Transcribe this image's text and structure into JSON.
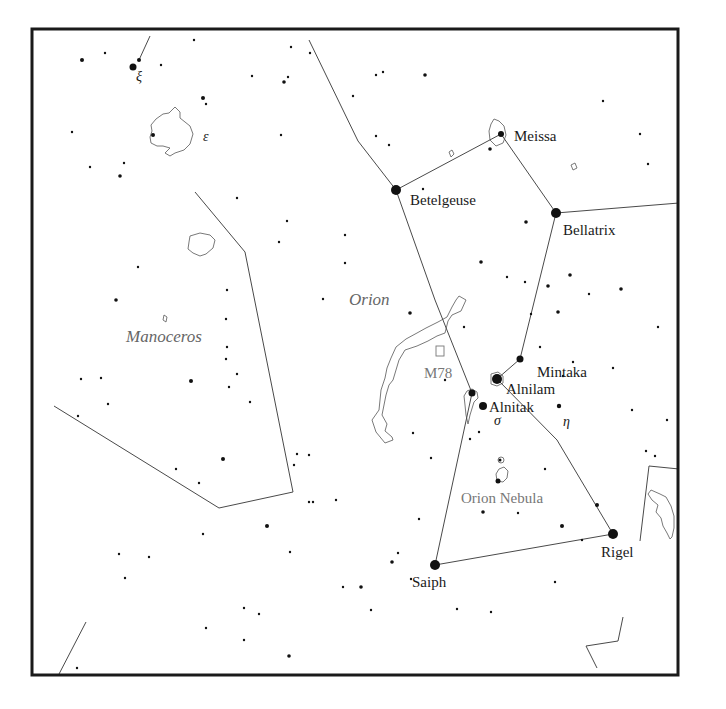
{
  "chart_title": "Orion star chart",
  "frame": {
    "x": 32,
    "y": 29,
    "w": 646,
    "h": 646
  },
  "constellations": [
    {
      "name": "Orion",
      "x": 349,
      "y": 305
    },
    {
      "name": "Manoceros",
      "x": 126,
      "y": 342
    }
  ],
  "deep_sky_objects": [
    {
      "name": "M78",
      "x": 424,
      "y": 378,
      "box": {
        "x": 436,
        "y": 346,
        "w": 8,
        "h": 10
      }
    },
    {
      "name": "Orion Nebula",
      "x": 461,
      "y": 503
    }
  ],
  "named_stars": [
    {
      "name": "Betelgeuse",
      "x": 396,
      "y": 190,
      "r": 5,
      "label_x": 410,
      "label_y": 205
    },
    {
      "name": "Meissa",
      "x": 501,
      "y": 134,
      "r": 3,
      "label_x": 514,
      "label_y": 141
    },
    {
      "name": "Bellatrix",
      "x": 556,
      "y": 213,
      "r": 5,
      "label_x": 563,
      "label_y": 235
    },
    {
      "name": "Mintaka",
      "x": 520,
      "y": 359,
      "r": 3.5,
      "label_x": 537,
      "label_y": 377
    },
    {
      "name": "Alnilam",
      "x": 497,
      "y": 379,
      "r": 5,
      "label_x": 506,
      "label_y": 394
    },
    {
      "name": "Alnitak",
      "x": 483,
      "y": 406,
      "r": 4,
      "label_x": 489,
      "label_y": 412
    },
    {
      "name": "Rigel",
      "x": 613,
      "y": 534,
      "r": 5,
      "label_x": 601,
      "label_y": 557
    },
    {
      "name": "Saiph",
      "x": 435,
      "y": 565,
      "r": 5,
      "label_x": 412,
      "label_y": 587
    }
  ],
  "greek_labels": [
    {
      "symbol": "σ",
      "x": 494,
      "y": 425
    },
    {
      "symbol": "η",
      "x": 563,
      "y": 426
    },
    {
      "symbol": "ξ",
      "x": 136,
      "y": 81
    },
    {
      "symbol": "ε",
      "x": 203,
      "y": 141
    }
  ],
  "constellation_lines": [
    {
      "points": [
        [
          309,
          40
        ],
        [
          358,
          141
        ],
        [
          396,
          190
        ],
        [
          435,
          300
        ],
        [
          472,
          393
        ],
        [
          435,
          565
        ],
        [
          613,
          534
        ],
        [
          557,
          440
        ],
        [
          497,
          379
        ],
        [
          520,
          359
        ],
        [
          556,
          213
        ],
        [
          679,
          203
        ]
      ]
    },
    {
      "points": [
        [
          396,
          190
        ],
        [
          501,
          134
        ],
        [
          556,
          213
        ]
      ]
    },
    {
      "points": [
        [
          150,
          36
        ],
        [
          139,
          60
        ]
      ]
    },
    {
      "points": [
        [
          195,
          192
        ],
        [
          245,
          252
        ],
        [
          293,
          492
        ],
        [
          219,
          508
        ],
        [
          54,
          406
        ]
      ]
    },
    {
      "points": [
        [
          649,
          466
        ],
        [
          640,
          541
        ]
      ]
    },
    {
      "points": [
        [
          649,
          466
        ],
        [
          679,
          469
        ]
      ]
    },
    {
      "points": [
        [
          86,
          622
        ],
        [
          58,
          676
        ]
      ]
    },
    {
      "points": [
        [
          623,
          617
        ],
        [
          618,
          641
        ],
        [
          586,
          646
        ],
        [
          597,
          668
        ]
      ]
    }
  ],
  "stars": [
    [
      133,
      67,
      3.5
    ],
    [
      139,
      60,
      2
    ],
    [
      82,
      60,
      2
    ],
    [
      105,
      53,
      1.2
    ],
    [
      161,
      65,
      1.2
    ],
    [
      194,
      40,
      1.2
    ],
    [
      203,
      98,
      2
    ],
    [
      206,
      104,
      1.2
    ],
    [
      153,
      135,
      2
    ],
    [
      72,
      132,
      1.2
    ],
    [
      90,
      167,
      1.2
    ],
    [
      124,
      163,
      1.2
    ],
    [
      120,
      176,
      1.8
    ],
    [
      252,
      76,
      1.2
    ],
    [
      284,
      82,
      1.8
    ],
    [
      288,
      77,
      1.2
    ],
    [
      281,
      135,
      1.2
    ],
    [
      291,
      47,
      1.2
    ],
    [
      310,
      53,
      1.2
    ],
    [
      353,
      96,
      1.2
    ],
    [
      383,
      72,
      1.2
    ],
    [
      376,
      75,
      1.2
    ],
    [
      237,
      198,
      1.2
    ],
    [
      287,
      221,
      1.2
    ],
    [
      279,
      242,
      1.2
    ],
    [
      345,
      235,
      1.2
    ],
    [
      345,
      263,
      1.2
    ],
    [
      138,
      267,
      1.2
    ],
    [
      116,
      300,
      1.8
    ],
    [
      227,
      290,
      1.2
    ],
    [
      226,
      319,
      1.2
    ],
    [
      323,
      299,
      1.2
    ],
    [
      227,
      347,
      1.2
    ],
    [
      226,
      359,
      1.2
    ],
    [
      237,
      374,
      1.2
    ],
    [
      101,
      378,
      1.2
    ],
    [
      81,
      379,
      1.2
    ],
    [
      191,
      381,
      2
    ],
    [
      229,
      387,
      1.2
    ],
    [
      250,
      402,
      1.2
    ],
    [
      108,
      404,
      1.2
    ],
    [
      78,
      416,
      1.2
    ],
    [
      223,
      459,
      2
    ],
    [
      176,
      469,
      1.2
    ],
    [
      199,
      483,
      1.2
    ],
    [
      297,
      454,
      1.2
    ],
    [
      294,
      465,
      1.2
    ],
    [
      309,
      455,
      1.2
    ],
    [
      309,
      502,
      1.2
    ],
    [
      313,
      502,
      1.2
    ],
    [
      336,
      500,
      1.2
    ],
    [
      267,
      526,
      2
    ],
    [
      203,
      534,
      1.2
    ],
    [
      290,
      552,
      1.2
    ],
    [
      119,
      554,
      1.2
    ],
    [
      149,
      557,
      1.2
    ],
    [
      125,
      578,
      1.2
    ],
    [
      244,
      608,
      1.2
    ],
    [
      259,
      614,
      1.2
    ],
    [
      206,
      628,
      1.2
    ],
    [
      244,
      640,
      1.2
    ],
    [
      289,
      656,
      1.8
    ],
    [
      77,
      668,
      1.2
    ],
    [
      343,
      587,
      1.2
    ],
    [
      361,
      587,
      1.8
    ],
    [
      425,
      75,
      1.8
    ],
    [
      376,
      136,
      1.2
    ],
    [
      389,
      145,
      1.2
    ],
    [
      423,
      189,
      1.2
    ],
    [
      490,
      149,
      1.8
    ],
    [
      603,
      101,
      1.2
    ],
    [
      640,
      134,
      1.2
    ],
    [
      648,
      164,
      1.2
    ],
    [
      526,
      222,
      1.8
    ],
    [
      481,
      262,
      1.8
    ],
    [
      507,
      277,
      1.2
    ],
    [
      525,
      282,
      1.2
    ],
    [
      570,
      275,
      1.8
    ],
    [
      548,
      286,
      1.8
    ],
    [
      589,
      294,
      1.2
    ],
    [
      621,
      289,
      1.8
    ],
    [
      658,
      327,
      1.2
    ],
    [
      558,
      312,
      1.8
    ],
    [
      531,
      314,
      1.2
    ],
    [
      540,
      347,
      1.2
    ],
    [
      410,
      313,
      1.8
    ],
    [
      464,
      327,
      1.2
    ],
    [
      563,
      376,
      1.2
    ],
    [
      573,
      362,
      1.2
    ],
    [
      613,
      368,
      1.2
    ],
    [
      559,
      406,
      2.2
    ],
    [
      632,
      410,
      1.2
    ],
    [
      667,
      420,
      1.2
    ],
    [
      445,
      380,
      1.2
    ],
    [
      479,
      432,
      1.2
    ],
    [
      470,
      439,
      1.2
    ],
    [
      431,
      458,
      1.2
    ],
    [
      545,
      469,
      1.2
    ],
    [
      597,
      505,
      2
    ],
    [
      562,
      526,
      2
    ],
    [
      582,
      540,
      1.2
    ],
    [
      518,
      513,
      1.2
    ],
    [
      483,
      512,
      1.8
    ],
    [
      419,
      519,
      1.2
    ],
    [
      398,
      553,
      1.2
    ],
    [
      411,
      579,
      1.2
    ],
    [
      555,
      582,
      1.2
    ],
    [
      491,
      612,
      1.2
    ],
    [
      371,
      610,
      1.2
    ],
    [
      457,
      609,
      1.2
    ],
    [
      646,
      451,
      1.2
    ],
    [
      655,
      456,
      1.2
    ],
    [
      498,
      481,
      2.5
    ],
    [
      500,
      460,
      1.5
    ],
    [
      472,
      393,
      3.5
    ],
    [
      392,
      562,
      1.8
    ],
    [
      413,
      433,
      1.2
    ]
  ]
}
